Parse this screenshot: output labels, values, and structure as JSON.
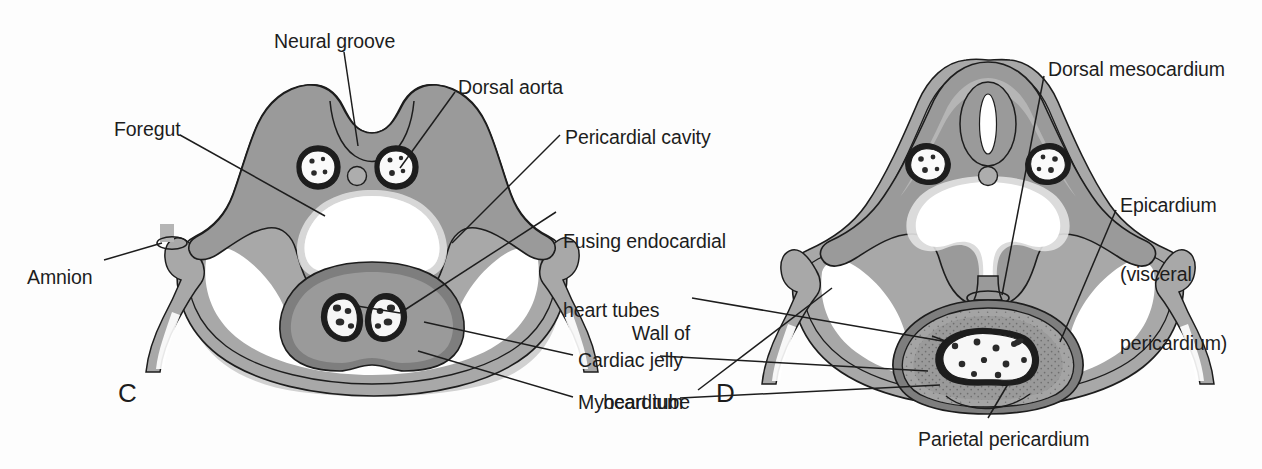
{
  "figure": {
    "background_color": "#fdfdfd",
    "line_color": "#1d1d1d"
  },
  "palette": {
    "outline": "#1d1d1d",
    "mesoderm_mid_gray": "#9a9a9a",
    "mesoderm_dark_gray": "#7d7d7d",
    "ectoderm_light_gray": "#b9b9b9",
    "pale_gray": "#cfcfcf",
    "cavity_white": "#ffffff",
    "shadow_gray": "#c6c6c6",
    "cell_fill": "#f4f4f4",
    "nucleus": "#2a2a2a"
  },
  "panels": [
    {
      "id": "C",
      "letter": "C",
      "letter_x": 118,
      "letter_y": 378
    },
    {
      "id": "D",
      "letter": "D",
      "letter_x": 716,
      "letter_y": 378
    }
  ],
  "labels": [
    {
      "name": "neural-groove",
      "text": "Neural groove",
      "lines": [
        "Neural groove"
      ],
      "x": 274,
      "y": 30,
      "align": "left",
      "panel": "C"
    },
    {
      "name": "dorsal-aorta",
      "text": "Dorsal aorta",
      "lines": [
        "Dorsal aorta"
      ],
      "x": 458,
      "y": 76,
      "align": "left",
      "panel": "C"
    },
    {
      "name": "foregut",
      "text": "Foregut",
      "lines": [
        "Foregut"
      ],
      "x": 114,
      "y": 118,
      "align": "left",
      "panel": "C"
    },
    {
      "name": "pericardial-cavity",
      "text": "Pericardial cavity",
      "lines": [
        "Pericardial cavity"
      ],
      "x": 565,
      "y": 126,
      "align": "left",
      "panel": "C"
    },
    {
      "name": "fusing-endocardial-heart-tubes",
      "text": "Fusing endocardial heart tubes",
      "lines": [
        "Fusing endocardial",
        "heart tubes"
      ],
      "x": 563,
      "y": 184,
      "align": "left",
      "panel": "C"
    },
    {
      "name": "amnion",
      "text": "Amnion",
      "lines": [
        "Amnion"
      ],
      "x": 27,
      "y": 266,
      "align": "left",
      "panel": "C"
    },
    {
      "name": "wall-of-heart-tube",
      "text": "Wall of heart tube",
      "lines": [
        "Wall of",
        "heart tube"
      ],
      "x": 605,
      "y": 276,
      "align": "left",
      "panel": "D"
    },
    {
      "name": "cardiac-jelly",
      "text": "Cardiac jelly",
      "lines": [
        "Cardiac jelly"
      ],
      "x": 578,
      "y": 349,
      "align": "left",
      "panel": "D"
    },
    {
      "name": "myocardium",
      "text": "Myocardium",
      "lines": [
        "Myocardium"
      ],
      "x": 578,
      "y": 391,
      "align": "left",
      "panel": "C"
    },
    {
      "name": "dorsal-mesocardium",
      "text": "Dorsal mesocardium",
      "lines": [
        "Dorsal mesocardium"
      ],
      "x": 1048,
      "y": 58,
      "align": "left",
      "panel": "D"
    },
    {
      "name": "epicardium-visceral-pericardium",
      "text": "Epicardium (visceral pericardium)",
      "lines": [
        "Epicardium",
        "(visceral",
        "pericardium)"
      ],
      "x": 1120,
      "y": 148,
      "align": "left",
      "panel": "D"
    },
    {
      "name": "parietal-pericardium",
      "text": "Parietal pericardium",
      "lines": [
        "Parietal pericardium"
      ],
      "x": 918,
      "y": 428,
      "align": "left",
      "panel": "D"
    }
  ],
  "structures": {
    "C": [
      "neural groove (open dorsal groove)",
      "paired dorsal aortae",
      "notochord",
      "foregut",
      "intraembryonic coelom / pericardial cavity",
      "fusing endocardial heart tubes (paired)",
      "cardiac jelly",
      "myocardium (splanchnic mesoderm)",
      "amnion attachment at body wall"
    ],
    "D": [
      "neural tube (closed)",
      "paired dorsal aortae",
      "notochord",
      "foregut",
      "dorsal mesocardium",
      "single heart tube lumen",
      "wall of heart tube (endocardium)",
      "cardiac jelly",
      "myocardium",
      "epicardium (visceral pericardium)",
      "parietal pericardium",
      "pericardial cavity"
    ]
  }
}
